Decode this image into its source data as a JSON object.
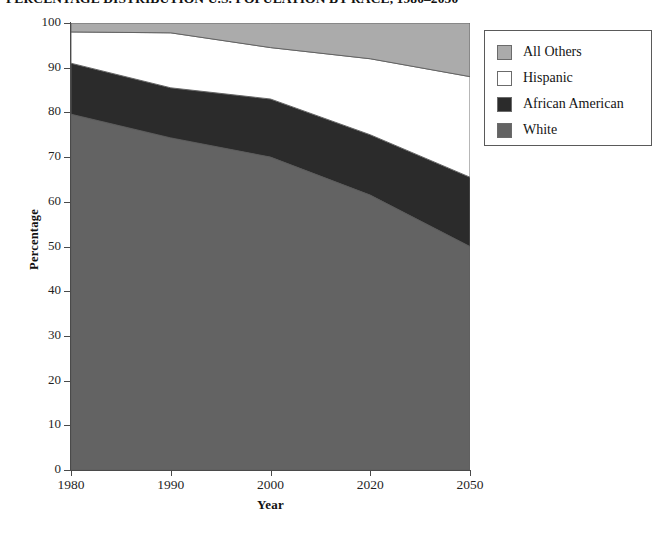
{
  "chart_data": {
    "type": "area",
    "title": "PERCENTAGE DISTRIBUTION U.S. POPULATION BY RACE, 1980–2050",
    "xlabel": "Year",
    "ylabel": "Percentage",
    "categories": [
      "1980",
      "1990",
      "2000",
      "2020",
      "2050"
    ],
    "x": [
      1980,
      1990,
      2000,
      2020,
      2050
    ],
    "ylim": [
      0,
      100
    ],
    "yticks": [
      0,
      10,
      20,
      30,
      40,
      50,
      60,
      70,
      80,
      90,
      100
    ],
    "ytick_labels": [
      "0",
      "10",
      "20",
      "30",
      "40",
      "50",
      "60",
      "70",
      "80",
      "90",
      "100"
    ],
    "grid": false,
    "stacked": true,
    "stack_order_bottom_to_top": [
      "White",
      "African American",
      "Hispanic",
      "All Others"
    ],
    "legend_position": "right-top",
    "series": [
      {
        "name": "White",
        "color": "#636363",
        "values": [
          79.6,
          74.3,
          70.0,
          61.5,
          50.0
        ]
      },
      {
        "name": "African American",
        "color": "#2b2b2b",
        "values": [
          11.4,
          11.2,
          13.0,
          13.5,
          15.5
        ]
      },
      {
        "name": "Hispanic",
        "color": "#ffffff",
        "values": [
          7.0,
          12.3,
          11.5,
          17.0,
          22.5
        ]
      },
      {
        "name": "All Others",
        "color": "#ababab",
        "values": [
          2.0,
          2.2,
          5.5,
          8.0,
          12.0
        ]
      }
    ],
    "cumulative_tops": {
      "White": [
        79.6,
        74.3,
        70.0,
        61.5,
        50.0
      ],
      "African American": [
        91.0,
        85.5,
        83.0,
        75.0,
        65.5
      ],
      "Hispanic": [
        98.0,
        97.8,
        94.5,
        92.0,
        88.0
      ],
      "All Others": [
        100,
        100,
        100,
        100,
        100
      ]
    }
  },
  "legend": {
    "items": [
      {
        "label": "All Others",
        "color": "#ababab"
      },
      {
        "label": "Hispanic",
        "color": "#ffffff"
      },
      {
        "label": "African American",
        "color": "#2b2b2b"
      },
      {
        "label": "White",
        "color": "#636363"
      }
    ]
  },
  "colors": {
    "axis": "#4a4a4a",
    "text": "#1a1a1a",
    "background": "#ffffff",
    "legend_border": "#5a5a5a"
  }
}
